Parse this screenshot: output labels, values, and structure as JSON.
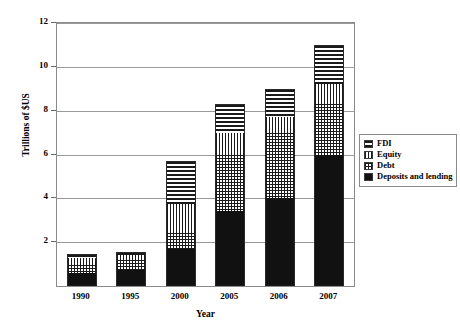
{
  "chart_data": {
    "type": "bar",
    "stacked": true,
    "title": "",
    "xlabel": "Year",
    "ylabel": "Trillions of $US",
    "categories": [
      "1990",
      "1995",
      "2000",
      "2005",
      "2006",
      "2007"
    ],
    "ylim": [
      0,
      12
    ],
    "yticks": [
      0,
      2,
      4,
      6,
      8,
      10,
      12
    ],
    "ytick_labels": [
      "",
      "2",
      "4",
      "6",
      "8",
      "10",
      "12"
    ],
    "grid": true,
    "legend_position": "right",
    "series": [
      {
        "name": "Deposits and lending",
        "pattern": "solid-black",
        "values": [
          0.6,
          0.75,
          1.7,
          3.4,
          4.0,
          6.0
        ]
      },
      {
        "name": "Debt",
        "pattern": "crosshatch",
        "values": [
          0.35,
          0.45,
          0.7,
          2.6,
          3.0,
          2.3
        ]
      },
      {
        "name": "Equity",
        "pattern": "vertical-lines",
        "values": [
          0.35,
          0.2,
          1.35,
          1.0,
          0.7,
          0.9
        ]
      },
      {
        "name": "FDI",
        "pattern": "horizontal-lines",
        "values": [
          0.15,
          0.15,
          1.95,
          1.3,
          1.3,
          1.8
        ]
      }
    ],
    "totals": [
      1.45,
      1.55,
      5.7,
      8.3,
      9.0,
      11.0
    ]
  },
  "legend": {
    "items": [
      {
        "label": "FDI",
        "pattern": "horizontal-lines"
      },
      {
        "label": "Equity",
        "pattern": "vertical-lines"
      },
      {
        "label": "Debt",
        "pattern": "crosshatch"
      },
      {
        "label": "Deposits and lending",
        "pattern": "solid-black"
      }
    ]
  },
  "axes": {
    "y_title": "Trillions of $US",
    "x_title": "Year"
  },
  "colors": {
    "ink": "#111111",
    "frame": "#8a8a8a",
    "grid": "#9a9a9a",
    "background": "#ffffff"
  }
}
